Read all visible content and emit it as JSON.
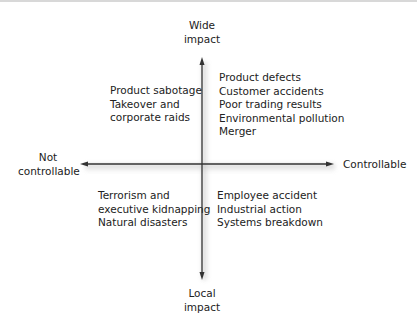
{
  "axes": {
    "top_label": [
      "Wide",
      "impact"
    ],
    "bottom_label": [
      "Local",
      "impact"
    ],
    "left_label": [
      "Not",
      "controllable"
    ],
    "right_label": [
      "Controllable"
    ]
  },
  "quadrants": {
    "top_left": [
      "Product sabotage",
      "Takeover and",
      "corporate raids"
    ],
    "top_right": [
      "Product defects",
      "Customer accidents",
      "Poor trading results",
      "Environmental pollution",
      "Merger"
    ],
    "bottom_left": [
      "Terrorism and",
      "executive kidnapping",
      "Natural disasters"
    ],
    "bottom_right": [
      "Employee accident",
      "Industrial action",
      "Systems breakdown"
    ]
  },
  "colors": {
    "axis": "#333333",
    "text": "#222222"
  }
}
